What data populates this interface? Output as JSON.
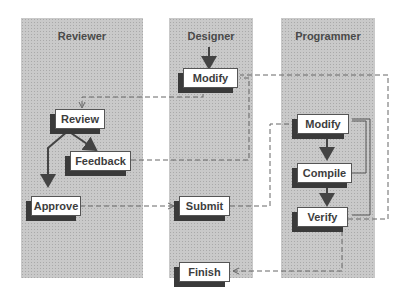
{
  "lanes": [
    {
      "id": "reviewer",
      "title": "Reviewer"
    },
    {
      "id": "designer",
      "title": "Designer"
    },
    {
      "id": "programmer",
      "title": "Programmer"
    }
  ],
  "nodes": {
    "designer_modify": {
      "label": "Modify",
      "lane": "Designer"
    },
    "review": {
      "label": "Review",
      "lane": "Reviewer"
    },
    "feedback": {
      "label": "Feedback",
      "lane": "Reviewer"
    },
    "approve": {
      "label": "Approve",
      "lane": "Reviewer"
    },
    "submit": {
      "label": "Submit",
      "lane": "Designer"
    },
    "finish": {
      "label": "Finish",
      "lane": "Designer"
    },
    "programmer_modify": {
      "label": "Modify",
      "lane": "Programmer"
    },
    "compile": {
      "label": "Compile",
      "lane": "Programmer"
    },
    "verify": {
      "label": "Verify",
      "lane": "Programmer"
    }
  },
  "edges": [
    {
      "from": "start",
      "to": "designer_modify",
      "style": "solid"
    },
    {
      "from": "designer_modify",
      "to": "review",
      "style": "dashed"
    },
    {
      "from": "review",
      "to": "feedback",
      "style": "solid"
    },
    {
      "from": "review",
      "to": "approve",
      "style": "solid"
    },
    {
      "from": "feedback",
      "to": "designer_modify",
      "style": "dashed"
    },
    {
      "from": "approve",
      "to": "submit",
      "style": "dashed"
    },
    {
      "from": "submit",
      "to": "programmer_modify",
      "style": "dashed"
    },
    {
      "from": "programmer_modify",
      "to": "compile",
      "style": "solid"
    },
    {
      "from": "compile",
      "to": "verify",
      "style": "solid"
    },
    {
      "from": "compile",
      "to": "programmer_modify",
      "style": "solid"
    },
    {
      "from": "verify",
      "to": "programmer_modify",
      "style": "solid"
    },
    {
      "from": "verify",
      "to": "designer_modify",
      "style": "dashed"
    },
    {
      "from": "verify",
      "to": "finish",
      "style": "dashed"
    }
  ],
  "colors": {
    "lane": "#c9c9c9",
    "shadow": "#3a3a3a",
    "line": "#555555",
    "text": "#3d3d3d"
  }
}
